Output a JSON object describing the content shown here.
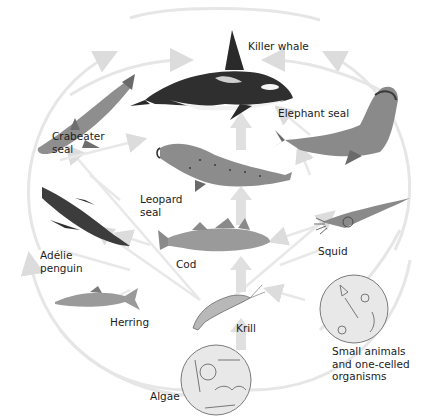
{
  "diagram": {
    "colors": {
      "arrow": "#e2e2e2",
      "arrow_strong": "#d6d6d6",
      "organism_dark": "#3a3a3a",
      "organism_mid": "#8a8a8a",
      "organism_light": "#d4d4d4",
      "circle_fill": "#e6e6e6",
      "circle_stroke": "#7a7a7a"
    },
    "nodes": [
      {
        "id": "killer_whale",
        "label": "Killer whale",
        "icon": "killer-whale-icon"
      },
      {
        "id": "elephant_seal",
        "label": "Elephant seal",
        "icon": "elephant-seal-icon"
      },
      {
        "id": "crabeater_seal",
        "label": "Crabeater\nseal",
        "label_lines": [
          "Crabeater",
          "seal"
        ],
        "icon": "crabeater-seal-icon"
      },
      {
        "id": "leopard_seal",
        "label": "Leopard\nseal",
        "label_lines": [
          "Leopard",
          "seal"
        ],
        "icon": "leopard-seal-icon"
      },
      {
        "id": "adelie_penguin",
        "label": "Adélie\npenguin",
        "label_lines": [
          "Adélie",
          "penguin"
        ],
        "icon": "penguin-icon"
      },
      {
        "id": "cod",
        "label": "Cod",
        "icon": "cod-icon"
      },
      {
        "id": "squid",
        "label": "Squid",
        "icon": "squid-icon"
      },
      {
        "id": "herring",
        "label": "Herring",
        "icon": "herring-icon"
      },
      {
        "id": "krill",
        "label": "Krill",
        "icon": "krill-icon"
      },
      {
        "id": "small_animals",
        "label": "Small animals\nand one-celled\norganisms",
        "label_lines": [
          "Small animals",
          "and one-celled",
          "organisms"
        ],
        "icon": "plankton-circle-icon"
      },
      {
        "id": "algae",
        "label": "Algae",
        "icon": "algae-circle-icon"
      }
    ],
    "edges": [
      {
        "from": "algae",
        "to": "krill"
      },
      {
        "from": "algae",
        "to": "small_animals"
      },
      {
        "from": "krill",
        "to": "cod"
      },
      {
        "from": "krill",
        "to": "herring"
      },
      {
        "from": "krill",
        "to": "crabeater_seal"
      },
      {
        "from": "krill",
        "to": "adelie_penguin"
      },
      {
        "from": "krill",
        "to": "squid"
      },
      {
        "from": "small_animals",
        "to": "squid"
      },
      {
        "from": "small_animals",
        "to": "krill"
      },
      {
        "from": "cod",
        "to": "leopard_seal"
      },
      {
        "from": "cod",
        "to": "adelie_penguin"
      },
      {
        "from": "herring",
        "to": "adelie_penguin"
      },
      {
        "from": "squid",
        "to": "elephant_seal"
      },
      {
        "from": "squid",
        "to": "cod"
      },
      {
        "from": "leopard_seal",
        "to": "killer_whale"
      },
      {
        "from": "adelie_penguin",
        "to": "leopard_seal"
      },
      {
        "from": "crabeater_seal",
        "to": "killer_whale"
      },
      {
        "from": "elephant_seal",
        "to": "killer_whale"
      }
    ]
  }
}
